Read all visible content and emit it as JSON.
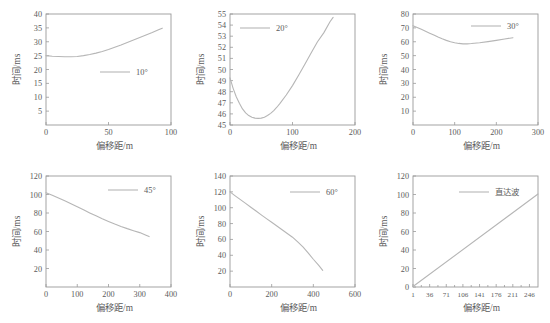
{
  "figure": {
    "background": "#ffffff",
    "curve_color": "#b6b6b6",
    "axis_color": "#9a9a9a",
    "text_color": "#5b5b5b",
    "xlabel": "偏移距/m",
    "ylabel": "时间/ms"
  },
  "chart_data": [
    {
      "type": "line",
      "title": "",
      "legend": "10°",
      "legend_position": "center-right",
      "xlabel": "偏移距/m",
      "ylabel": "时间/ms",
      "xlim": [
        0,
        100
      ],
      "ylim": [
        0,
        40
      ],
      "xticks": [
        0,
        50,
        100
      ],
      "yticks": [
        5,
        10,
        15,
        20,
        25,
        30,
        35,
        40
      ],
      "grid": false,
      "x": [
        0,
        5,
        10,
        15,
        20,
        25,
        30,
        35,
        40,
        45,
        50,
        55,
        60,
        65,
        70,
        75,
        80,
        85,
        90,
        93
      ],
      "y": [
        25.0,
        24.8,
        24.7,
        24.6,
        24.6,
        24.7,
        25.0,
        25.4,
        25.9,
        26.5,
        27.2,
        28.0,
        28.8,
        29.7,
        30.6,
        31.5,
        32.4,
        33.3,
        34.3,
        34.9
      ]
    },
    {
      "type": "line",
      "title": "",
      "legend": "20°",
      "legend_position": "top-center",
      "xlabel": "偏移距/m",
      "ylabel": "时间/ms",
      "xlim": [
        0,
        200
      ],
      "ylim": [
        45,
        55
      ],
      "xticks": [
        0,
        100,
        200
      ],
      "yticks": [
        45,
        46,
        47,
        48,
        49,
        50,
        51,
        52,
        53,
        54,
        55
      ],
      "grid": false,
      "x": [
        0,
        5,
        10,
        15,
        20,
        25,
        30,
        35,
        40,
        45,
        50,
        55,
        60,
        65,
        70,
        75,
        80,
        90,
        100,
        110,
        120,
        130,
        140,
        150,
        160,
        165
      ],
      "y": [
        49.25,
        48.3,
        47.55,
        46.95,
        46.45,
        46.1,
        45.85,
        45.7,
        45.62,
        45.6,
        45.62,
        45.7,
        45.85,
        46.05,
        46.3,
        46.6,
        46.95,
        47.7,
        48.55,
        49.5,
        50.5,
        51.5,
        52.5,
        53.3,
        54.3,
        54.7
      ]
    },
    {
      "type": "line",
      "title": "",
      "legend": "30°",
      "legend_position": "top-right",
      "xlabel": "偏移距/m",
      "ylabel": "时间/ms",
      "xlim": [
        0,
        300
      ],
      "ylim": [
        0,
        80
      ],
      "xticks": [
        0,
        100,
        200,
        300
      ],
      "yticks": [
        10,
        20,
        30,
        40,
        50,
        60,
        70,
        80
      ],
      "grid": false,
      "x": [
        0,
        10,
        20,
        30,
        40,
        50,
        60,
        70,
        80,
        90,
        100,
        110,
        120,
        130,
        140,
        160,
        180,
        200,
        220,
        240
      ],
      "y": [
        71.5,
        70.3,
        69.0,
        67.6,
        66.2,
        64.8,
        63.4,
        62.1,
        61.0,
        60.0,
        59.3,
        58.8,
        58.5,
        58.5,
        58.7,
        59.3,
        60.1,
        61.0,
        62.0,
        62.9
      ]
    },
    {
      "type": "line",
      "title": "",
      "legend": "45°",
      "legend_position": "top-right",
      "xlabel": "偏移距/m",
      "ylabel": "时间/ms",
      "xlim": [
        0,
        400
      ],
      "ylim": [
        0,
        120
      ],
      "xticks": [
        0,
        100,
        200,
        300,
        400
      ],
      "yticks": [
        20,
        40,
        60,
        80,
        100,
        120
      ],
      "grid": false,
      "x": [
        0,
        20,
        40,
        60,
        80,
        100,
        120,
        140,
        160,
        180,
        200,
        220,
        240,
        260,
        280,
        300,
        320,
        330
      ],
      "y": [
        102.0,
        99.3,
        96.3,
        93.2,
        90.0,
        86.7,
        83.4,
        80.1,
        76.9,
        73.8,
        70.9,
        68.1,
        65.5,
        63.1,
        60.9,
        58.8,
        56.0,
        54.5
      ]
    },
    {
      "type": "line",
      "title": "",
      "legend": "60°",
      "legend_position": "top-right",
      "xlabel": "偏移距/m",
      "ylabel": "时间/ms",
      "xlim": [
        0,
        600
      ],
      "ylim": [
        0,
        140
      ],
      "xticks": [
        0,
        200,
        400,
        600
      ],
      "yticks": [
        20,
        40,
        60,
        80,
        100,
        120,
        140
      ],
      "grid": false,
      "x": [
        0,
        25,
        50,
        75,
        100,
        125,
        150,
        175,
        200,
        225,
        250,
        275,
        300,
        325,
        350,
        375,
        400,
        425,
        445
      ],
      "y": [
        120.0,
        115.0,
        110.2,
        105.4,
        100.6,
        95.8,
        91.0,
        86.3,
        81.6,
        76.9,
        72.2,
        67.5,
        62.8,
        57.0,
        50.5,
        43.0,
        35.0,
        27.5,
        21.0
      ]
    },
    {
      "type": "line",
      "title": "",
      "legend": "直达波",
      "legend_position": "top-center",
      "xlabel": "偏移距/m",
      "ylabel": "时间/ms",
      "xlim": [
        1,
        264
      ],
      "ylim": [
        0,
        120
      ],
      "xticks": [
        1,
        36,
        71,
        106,
        141,
        176,
        211,
        246
      ],
      "yticks": [
        0,
        20,
        40,
        60,
        80,
        100,
        120
      ],
      "grid": false,
      "x": [
        1,
        264
      ],
      "y": [
        0.5,
        100.5
      ]
    }
  ],
  "panels": [
    {
      "name": "panel-10deg",
      "index": 0
    },
    {
      "name": "panel-20deg",
      "index": 1
    },
    {
      "name": "panel-30deg",
      "index": 2
    },
    {
      "name": "panel-45deg",
      "index": 3
    },
    {
      "name": "panel-60deg",
      "index": 4
    },
    {
      "name": "panel-direct-wave",
      "index": 5
    }
  ]
}
